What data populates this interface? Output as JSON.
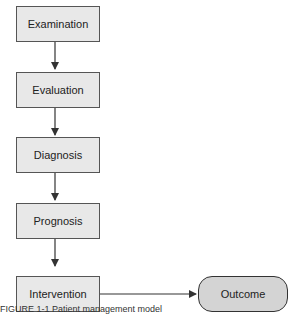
{
  "diagram": {
    "type": "flowchart",
    "steps": [
      {
        "label": "Examination"
      },
      {
        "label": "Evaluation"
      },
      {
        "label": "Diagnosis"
      },
      {
        "label": "Prognosis"
      },
      {
        "label": "Intervention"
      }
    ],
    "outcome": {
      "label": "Outcome"
    },
    "edges": [
      [
        "Examination",
        "Evaluation"
      ],
      [
        "Evaluation",
        "Diagnosis"
      ],
      [
        "Diagnosis",
        "Prognosis"
      ],
      [
        "Prognosis",
        "Intervention"
      ],
      [
        "Intervention",
        "Outcome"
      ]
    ],
    "colors": {
      "box_fill": "#e8e8e8",
      "outcome_fill": "#d4d4d4",
      "stroke": "#333333"
    }
  },
  "caption": {
    "text": "FIGURE 1-1  Patient management model"
  }
}
